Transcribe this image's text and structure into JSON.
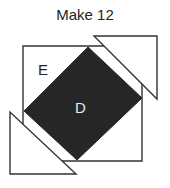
{
  "title": "Make 12",
  "labels": {
    "outer": "E",
    "inner": "D"
  },
  "colors": {
    "dark_fill": "#262626",
    "stroke": "#333333",
    "background": "#ffffff",
    "inner_label": "#e8e8e8",
    "outer_label": "#222222"
  }
}
